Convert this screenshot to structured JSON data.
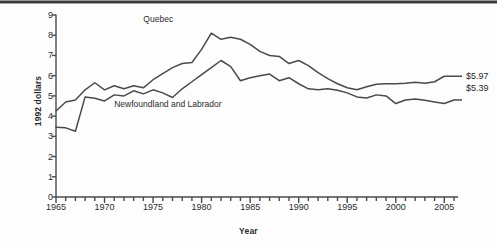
{
  "chart_data": {
    "type": "line",
    "title": "",
    "xlabel": "Year",
    "ylabel": "1992 dollars",
    "xlim": [
      1965,
      2006
    ],
    "ylim": [
      0,
      9
    ],
    "grid": false,
    "legend_position": "inline-annotation",
    "yticks": [
      0,
      1,
      2,
      3,
      4,
      5,
      6,
      7,
      8,
      9
    ],
    "ytick_labels": [
      "0",
      "1",
      "2",
      "3",
      "4",
      "5",
      "6",
      "7",
      "8",
      "9"
    ],
    "xticks": [
      1965,
      1970,
      1975,
      1980,
      1985,
      1990,
      1995,
      2000,
      2005
    ],
    "xtick_labels": [
      "1965",
      "1970",
      "1975",
      "1980",
      "1985",
      "1990",
      "1995",
      "2000",
      "2005"
    ],
    "minor_xtick_interval": 1,
    "x": [
      1965,
      1966,
      1967,
      1968,
      1969,
      1970,
      1971,
      1972,
      1973,
      1974,
      1975,
      1976,
      1977,
      1978,
      1979,
      1980,
      1981,
      1982,
      1983,
      1984,
      1985,
      1986,
      1987,
      1988,
      1989,
      1990,
      1991,
      1992,
      1993,
      1994,
      1995,
      1996,
      1997,
      1998,
      1999,
      2000,
      2001,
      2002,
      2003,
      2004,
      2005,
      2006
    ],
    "series": [
      {
        "name": "Quebec",
        "end_label": "$5.97",
        "end_value": 5.97,
        "color": "#4a4a4a",
        "values": [
          4.25,
          4.7,
          4.8,
          5.3,
          5.65,
          5.3,
          5.5,
          5.35,
          5.5,
          5.4,
          5.8,
          6.1,
          6.4,
          6.6,
          6.65,
          7.3,
          8.1,
          7.8,
          7.9,
          7.8,
          7.55,
          7.2,
          7.0,
          6.95,
          6.6,
          6.75,
          6.5,
          6.15,
          5.85,
          5.6,
          5.4,
          5.3,
          5.45,
          5.58,
          5.6,
          5.6,
          5.62,
          5.68,
          5.62,
          5.7,
          5.97,
          5.97
        ]
      },
      {
        "name": "Newfoundland and Labrador",
        "end_label": "$5.39",
        "end_value": 5.39,
        "color": "#4a4a4a",
        "values": [
          3.45,
          3.42,
          3.25,
          4.95,
          4.88,
          4.75,
          5.05,
          5.0,
          5.25,
          5.1,
          5.3,
          5.15,
          4.92,
          5.35,
          5.7,
          6.05,
          6.4,
          6.75,
          6.45,
          5.75,
          5.9,
          6.0,
          6.08,
          5.75,
          5.9,
          5.6,
          5.35,
          5.3,
          5.35,
          5.28,
          5.15,
          4.95,
          4.9,
          5.05,
          5.0,
          4.62,
          4.8,
          4.85,
          4.78,
          4.7,
          4.62,
          4.8
        ]
      }
    ],
    "annotations": [
      {
        "text": "Quebec",
        "x": 1974,
        "y": 8.75
      },
      {
        "text": "Newfoundland and Labrador",
        "x": 1971,
        "y": 4.55
      }
    ]
  },
  "axis": {
    "ylabel": "1992 dollars",
    "xlabel": "Year"
  },
  "colors": {
    "line": "#4a4a4a",
    "axis": "#4a4a4a",
    "text": "#2b2b2b",
    "background": "#fdfdfd"
  }
}
